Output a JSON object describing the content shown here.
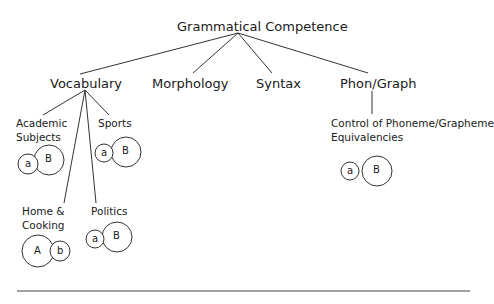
{
  "title": "Grammatical Competence",
  "branches": [
    {
      "label": "Vocabulary"
    },
    {
      "label": "Morphology"
    },
    {
      "label": "Syntax"
    },
    {
      "label": "Phon/Graph"
    }
  ],
  "vocabulary_children": [
    {
      "label_line1": "Academic",
      "label_line2": "Subjects",
      "circles": [
        {
          "text": "a",
          "size": "small"
        },
        {
          "text": "B",
          "size": "large"
        }
      ]
    },
    {
      "label_line1": "Sports",
      "label_line2": "",
      "circles": [
        {
          "text": "a",
          "size": "small"
        },
        {
          "text": "B",
          "size": "large"
        }
      ]
    },
    {
      "label_line1": "Home &",
      "label_line2": "Cooking",
      "circles": [
        {
          "text": "A",
          "size": "large"
        },
        {
          "text": "b",
          "size": "small"
        }
      ]
    },
    {
      "label_line1": "Politics",
      "label_line2": "",
      "circles": [
        {
          "text": "a",
          "size": "small"
        },
        {
          "text": "B",
          "size": "large"
        }
      ]
    }
  ],
  "phon_graph_child": {
    "label_line1": "Control of Phoneme/Grapheme",
    "label_line2": "Equivalencies",
    "circles": [
      {
        "text": "a",
        "size": "small"
      },
      {
        "text": "B",
        "size": "large"
      }
    ]
  }
}
